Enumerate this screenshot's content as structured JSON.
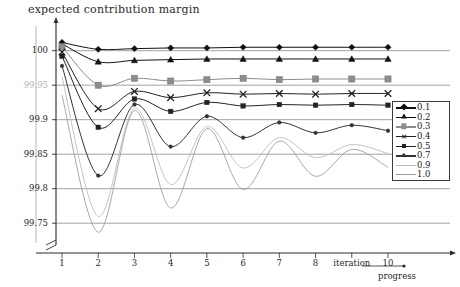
{
  "chart_data": {
    "type": "line",
    "title": "expected contribution margin",
    "xlabel": "iteration",
    "ylabel": "",
    "sublabel": "progress",
    "grid": true,
    "legend_position": "right",
    "x": [
      1,
      2,
      3,
      4,
      5,
      6,
      7,
      8,
      9,
      10
    ],
    "xlim": [
      1,
      10
    ],
    "ylim": [
      99.73,
      100.03
    ],
    "ytick_labels": [
      "100",
      "99.95",
      "99.9",
      "99.85",
      "99.8",
      "99.75"
    ],
    "ytick_values": [
      100,
      99.95,
      99.9,
      99.85,
      99.8,
      99.75
    ],
    "xtick_labels": [
      "1",
      "2",
      "3",
      "4",
      "5",
      "6",
      "7",
      "8",
      "iteration",
      "10"
    ],
    "series": [
      {
        "name": "0.1",
        "marker": "diamond",
        "color": "#111111",
        "values": [
          100.012,
          100.002,
          100.003,
          100.004,
          100.004,
          100.005,
          100.005,
          100.005,
          100.005,
          100.005
        ]
      },
      {
        "name": "0.2",
        "marker": "triangle",
        "color": "#111111",
        "values": [
          100.01,
          99.984,
          99.986,
          99.987,
          99.988,
          99.988,
          99.988,
          99.988,
          99.988,
          99.988
        ]
      },
      {
        "name": "0.3",
        "marker": "square-gray",
        "color": "#8c8c8c",
        "values": [
          100.006,
          99.95,
          99.96,
          99.956,
          99.958,
          99.96,
          99.958,
          99.959,
          99.959,
          99.959
        ]
      },
      {
        "name": "0.4",
        "marker": "cross",
        "color": "#222222",
        "values": [
          99.998,
          99.916,
          99.941,
          99.932,
          99.939,
          99.937,
          99.938,
          99.937,
          99.938,
          99.938
        ]
      },
      {
        "name": "0.5",
        "marker": "small-square",
        "color": "#222222",
        "values": [
          99.992,
          99.889,
          99.93,
          99.912,
          99.925,
          99.92,
          99.922,
          99.921,
          99.922,
          99.921
        ]
      },
      {
        "name": "0.7",
        "marker": "dot",
        "color": "#333333",
        "values": [
          99.978,
          99.819,
          99.922,
          99.861,
          99.905,
          99.874,
          99.896,
          99.881,
          99.892,
          99.884
        ]
      },
      {
        "name": "0.9",
        "marker": "none",
        "color": "#b9b9b9",
        "values": [
          99.962,
          99.76,
          99.916,
          99.806,
          99.89,
          99.83,
          99.874,
          99.845,
          99.864,
          99.851
        ]
      },
      {
        "name": "1.0",
        "marker": "none",
        "color": "#9a9a9a",
        "values": [
          99.935,
          99.737,
          99.913,
          99.772,
          99.887,
          99.799,
          99.869,
          99.818,
          99.857,
          99.831
        ]
      }
    ]
  },
  "axes": {
    "y_arrow": "up-arrow",
    "x_arrow": "right-arrow",
    "break_symbol": "axis-break",
    "progress_arrow": "right-arrow"
  }
}
